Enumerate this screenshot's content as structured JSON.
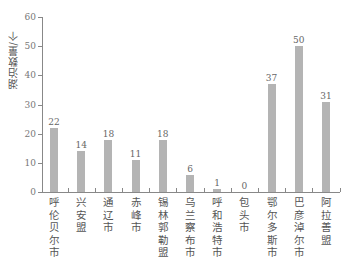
{
  "chart_data": {
    "type": "bar",
    "title": "",
    "xlabel": "",
    "ylabel": "湖泊数量/个",
    "ylim": [
      0,
      60
    ],
    "yticks": [
      0,
      10,
      20,
      30,
      40,
      50,
      60
    ],
    "grid": false,
    "legend": null,
    "bar_color": "#b4b4b4",
    "categories": [
      "呼伦贝尔市",
      "兴安盟",
      "通辽市",
      "赤峰市",
      "锡林郭勒盟",
      "乌兰察布市",
      "呼和浩特市",
      "包头市",
      "鄂尔多斯市",
      "巴彦淖尔市",
      "阿拉善盟"
    ],
    "values": [
      22,
      14,
      18,
      11,
      18,
      6,
      1,
      0,
      37,
      50,
      31
    ],
    "value_labels": [
      "22",
      "14",
      "18",
      "11",
      "18",
      "6",
      "1",
      "0",
      "37",
      "50",
      "31"
    ]
  },
  "caption": "（faint, illegible caption text）"
}
